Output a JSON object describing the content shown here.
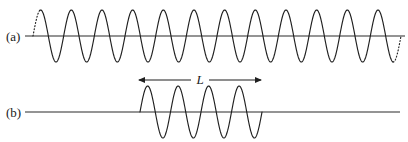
{
  "figure": {
    "background_color": "#ffffff",
    "stroke_color": "#1f1f1f",
    "width": 408,
    "height": 142
  },
  "panels": [
    {
      "id": "a",
      "label": "(a)",
      "label_x": 6,
      "label_y": 41,
      "description": "Infinite sinusoidal wave train extending beyond both edges",
      "axis": {
        "x_start": 25,
        "x_end": 405,
        "y": 36
      },
      "wave": {
        "x_start": 33,
        "x_end": 401,
        "baseline_y": 36,
        "amplitude": 26,
        "cycles": 12,
        "phase_deg": 0,
        "truncated_ends": true,
        "dotted_lead_length": 7,
        "dotted_tail_length": 8
      }
    },
    {
      "id": "b",
      "label": "(b)",
      "label_x": 6,
      "label_y": 117,
      "description": "Finite wave packet of length L on an otherwise flat axis",
      "axis": {
        "x_start": 25,
        "x_end": 400,
        "y": 112
      },
      "wave": {
        "x_start": 140,
        "x_end": 262,
        "baseline_y": 112,
        "amplitude": 26,
        "cycles": 4,
        "phase_deg": 0,
        "truncated_ends": false
      }
    }
  ],
  "annotations": [
    {
      "name": "length-dimension",
      "label": "L",
      "italic": true,
      "arrow_y": 80,
      "x_start": 138,
      "x_end": 262,
      "label_x": 200,
      "label_y": 84,
      "double_headed": true,
      "label_gap": 9
    }
  ]
}
